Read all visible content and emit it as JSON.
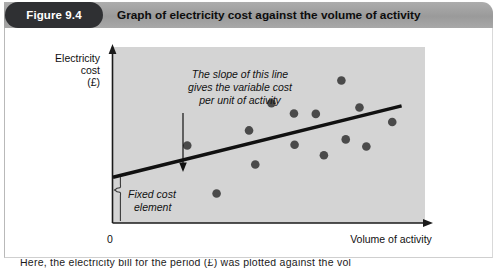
{
  "figure": {
    "badge_label": "Figure 9.4",
    "title": "Graph of electricity cost against the volume of activity"
  },
  "caption": {
    "text": "Here, the electricity bill for the period (£) was plotted against the vol"
  },
  "colors": {
    "header_bar": "#a3a3a3",
    "badge_bg": "#2f3033",
    "badge_text": "#ffffff",
    "title_text": "#0d0d0d",
    "plot_bg": "#d4d4d4",
    "axis": "#1a1a1a",
    "point": "#4a4a4a",
    "trend_line": "#111111",
    "annotation_text": "#111111"
  },
  "chart_data": {
    "type": "scatter",
    "title": "Graph of electricity cost against the volume of activity",
    "xlabel": "Volume of activity",
    "ylabel": "Electricity cost (£)",
    "ylabel_lines": [
      "Electricity",
      "cost",
      "(£)"
    ],
    "origin_label": "0",
    "grid": false,
    "legend": "none",
    "axis_ticks": {
      "x": [
        "0"
      ],
      "y": []
    },
    "xlim": [
      0,
      100
    ],
    "ylim": [
      0,
      100
    ],
    "points": [
      {
        "x": 23.8,
        "y": 44.0
      },
      {
        "x": 33.2,
        "y": 16.8
      },
      {
        "x": 43.6,
        "y": 52.6
      },
      {
        "x": 45.6,
        "y": 33.2
      },
      {
        "x": 50.8,
        "y": 68.0
      },
      {
        "x": 58.0,
        "y": 62.2
      },
      {
        "x": 58.2,
        "y": 44.5
      },
      {
        "x": 65.0,
        "y": 62.0
      },
      {
        "x": 67.6,
        "y": 38.5
      },
      {
        "x": 73.2,
        "y": 81.0
      },
      {
        "x": 74.6,
        "y": 47.5
      },
      {
        "x": 79.0,
        "y": 65.6
      },
      {
        "x": 81.2,
        "y": 43.5
      },
      {
        "x": 89.5,
        "y": 57.4
      }
    ],
    "trend_line": {
      "name": "Total cost line",
      "x0": 0.0,
      "y0": 26.0,
      "x1": 92.5,
      "y1": 66.5,
      "description": "Straight line of best fit; slope = variable cost per unit of activity; intercept = fixed cost element"
    },
    "annotations": [
      {
        "name": "slope-annotation",
        "lines": [
          "The slope of this line",
          "gives the variable cost",
          "per unit of activity"
        ],
        "style": "italic",
        "arrow_to": "trend line"
      },
      {
        "name": "fixed-cost-annotation",
        "lines": [
          "Fixed cost",
          "element"
        ],
        "style": "italic",
        "brace": true
      }
    ]
  }
}
